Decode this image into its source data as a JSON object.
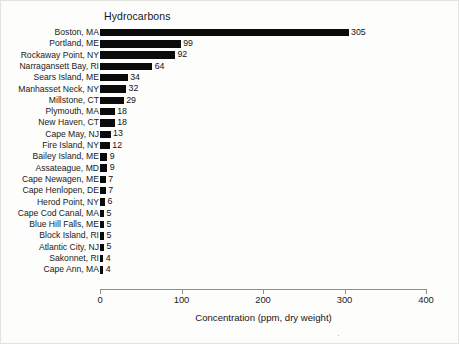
{
  "chart_data": {
    "type": "bar",
    "orientation": "horizontal",
    "title": "Hydrocarbons",
    "xlabel": "Concentration (ppm, dry weight)",
    "ylabel": "",
    "xlim": [
      0,
      400
    ],
    "xticks": [
      0,
      100,
      200,
      300,
      400
    ],
    "xtick_labels": [
      "0",
      "100",
      "200",
      "300",
      "400"
    ],
    "grid": false,
    "legend": false,
    "bar_color": "#0b0b0b",
    "background_color": "#fdfdfb",
    "axis_color": "#8e8e8b",
    "categories": [
      "Boston, MA",
      "Portland, ME",
      "Rockaway Point, NY",
      "Narragansett Bay, RI",
      "Sears Island, ME",
      "Manhasset Neck, NY",
      "Millstone, CT",
      "Plymouth, MA",
      "New Haven, CT",
      "Cape May, NJ",
      "Fire Island, NY",
      "Bailey Island, ME",
      "Assateague, MD",
      "Cape Newagen, ME",
      "Cape Henlopen, DE",
      "Herod Point, NY",
      "Cape Cod Canal, MA",
      "Blue Hill Falls, ME",
      "Block Island, RI",
      "Atlantic City, NJ",
      "Sakonnet, RI",
      "Cape Ann, MA"
    ],
    "values": [
      305,
      99,
      92,
      64,
      34,
      32,
      29,
      18,
      18,
      13,
      12,
      9,
      9,
      7,
      7,
      6,
      5,
      5,
      5,
      5,
      4,
      4
    ],
    "value_labels": [
      "305",
      "99",
      "92",
      "64",
      "34",
      "32",
      "29",
      "18",
      "18",
      "13",
      "12",
      "9",
      "9",
      "7",
      "7",
      "6",
      "5",
      "5",
      "5",
      "5",
      "4",
      "4"
    ]
  }
}
